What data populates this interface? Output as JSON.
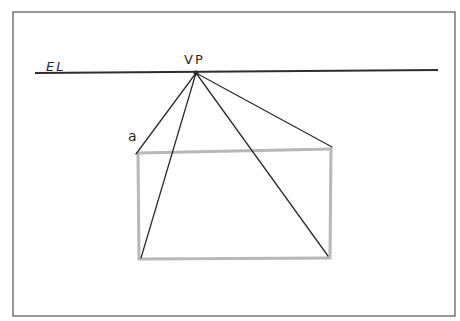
{
  "diagram": {
    "type": "one-point perspective sketch",
    "labels": {
      "eye_level": "EL",
      "vanishing_point": "VP",
      "corner": "a"
    },
    "colors": {
      "ink": "#2e2e2e",
      "pencil": "#b8b8b8",
      "frame": "#555555",
      "background": "#ffffff"
    },
    "frame": {
      "x": 13,
      "y": 12,
      "width": 442,
      "height": 304
    },
    "horizon": {
      "x1": 35,
      "y1": 73,
      "x2": 438,
      "y2": 70
    },
    "vanishing_point": {
      "x": 196,
      "y": 73
    },
    "rectangle": {
      "x": 138,
      "y": 151,
      "width": 192,
      "height": 107
    },
    "convergence_lines": [
      {
        "name": "to-corner-a",
        "x2": 136,
        "y2": 154
      },
      {
        "name": "to-bottom-left",
        "x2": 141,
        "y2": 258
      },
      {
        "name": "to-bottom-right",
        "x2": 328,
        "y2": 256
      },
      {
        "name": "to-top-right",
        "x2": 332,
        "y2": 147
      }
    ]
  }
}
